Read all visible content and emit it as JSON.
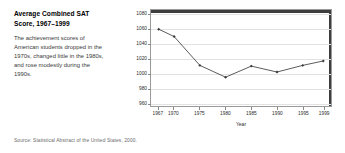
{
  "figure": {
    "title": "Average Combined SAT Score, 1967–1999",
    "description": "The achievement scores of American students dropped in the 1970s, changed little in the 1980s, and rose modestly during the 1990s.",
    "source": "Source: Statistical Abstract of the United States, 2000."
  },
  "chart_data": {
    "type": "line",
    "title": "",
    "xlabel": "Year",
    "ylabel": "Combined SAT Score",
    "x": [
      1967,
      1970,
      1975,
      1980,
      1985,
      1990,
      1995,
      1999
    ],
    "values": [
      1059,
      1049,
      1010,
      994,
      1009,
      1001,
      1010,
      1016
    ],
    "series": [
      {
        "name": "Average Combined SAT Score",
        "values": [
          1059,
          1049,
          1010,
          994,
          1009,
          1001,
          1010,
          1016
        ]
      }
    ],
    "xtick_labels": [
      "1967",
      "1970",
      "1975",
      "1980",
      "1985",
      "1990",
      "1995",
      "1999"
    ],
    "ytick_labels": [
      "1080",
      "1060",
      "1040",
      "1020",
      "1000",
      "980",
      "960"
    ],
    "ytick_values": [
      1080,
      1060,
      1040,
      1020,
      1000,
      980,
      960
    ],
    "ylim": [
      955,
      1085
    ],
    "xlim": [
      1965.5,
      2000.5
    ],
    "grid": "horizontal",
    "legend": "none",
    "line_color": "#4a4a4a",
    "marker_color": "#3a3a3a",
    "marker": "diamond"
  }
}
